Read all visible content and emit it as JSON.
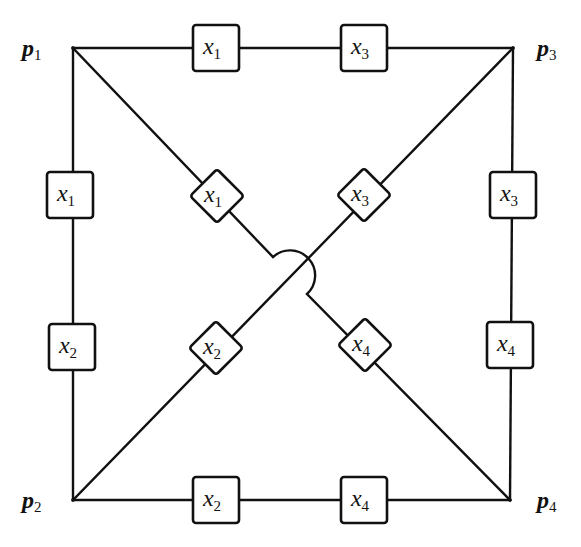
{
  "diagram": {
    "type": "switching-network",
    "terminals": [
      {
        "id": "p1",
        "letter": "p",
        "sub": "1",
        "x": 73,
        "y": 48,
        "label_x": 22,
        "label_y": 56
      },
      {
        "id": "p3",
        "letter": "p",
        "sub": "3",
        "x": 513,
        "y": 48,
        "label_x": 537,
        "label_y": 56
      },
      {
        "id": "p2",
        "letter": "p",
        "sub": "2",
        "x": 73,
        "y": 500,
        "label_x": 22,
        "label_y": 508
      },
      {
        "id": "p4",
        "letter": "p",
        "sub": "4",
        "x": 510,
        "y": 500,
        "label_x": 537,
        "label_y": 508
      }
    ],
    "edges": [
      {
        "name": "top-edge",
        "from": "p1",
        "to": "p3",
        "switches": [
          {
            "letter": "x",
            "sub": "1",
            "cx": 216,
            "cy": 48,
            "shape": "square"
          },
          {
            "letter": "x",
            "sub": "3",
            "cx": 364,
            "cy": 48,
            "shape": "square"
          }
        ]
      },
      {
        "name": "left-edge",
        "from": "p1",
        "to": "p2",
        "switches": [
          {
            "letter": "x",
            "sub": "1",
            "cx": 70,
            "cy": 195,
            "shape": "square"
          },
          {
            "letter": "x",
            "sub": "2",
            "cx": 72,
            "cy": 347,
            "shape": "square"
          }
        ]
      },
      {
        "name": "right-edge",
        "from": "p3",
        "to": "p4",
        "switches": [
          {
            "letter": "x",
            "sub": "3",
            "cx": 513,
            "cy": 195,
            "shape": "square"
          },
          {
            "letter": "x",
            "sub": "4",
            "cx": 510,
            "cy": 345,
            "shape": "square"
          }
        ]
      },
      {
        "name": "bottom-edge",
        "from": "p2",
        "to": "p4",
        "switches": [
          {
            "letter": "x",
            "sub": "2",
            "cx": 216,
            "cy": 500,
            "shape": "square"
          },
          {
            "letter": "x",
            "sub": "4",
            "cx": 364,
            "cy": 500,
            "shape": "square"
          }
        ]
      },
      {
        "name": "diagonal-p1-p4",
        "from": "p1",
        "to": "p4",
        "crosses_over": true,
        "switches": [
          {
            "letter": "x",
            "sub": "1",
            "cx": 217,
            "cy": 196,
            "shape": "diamond"
          },
          {
            "letter": "x",
            "sub": "4",
            "cx": 365,
            "cy": 345,
            "shape": "diamond"
          }
        ]
      },
      {
        "name": "diagonal-p2-p3",
        "from": "p2",
        "to": "p3",
        "switches": [
          {
            "letter": "x",
            "sub": "2",
            "cx": 216,
            "cy": 348,
            "shape": "diamond"
          },
          {
            "letter": "x",
            "sub": "3",
            "cx": 364,
            "cy": 195,
            "shape": "diamond"
          }
        ]
      }
    ],
    "crossover": {
      "break_start": [
        273,
        257
      ],
      "break_end": [
        307,
        294
      ],
      "arc_radius": 22
    }
  }
}
